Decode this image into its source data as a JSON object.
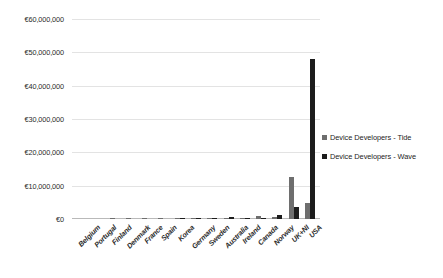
{
  "chart_data": {
    "type": "bar",
    "title": "",
    "xlabel": "",
    "ylabel": "",
    "ylim": [
      0,
      60000000
    ],
    "grid": true,
    "legend_position": "right",
    "currency_symbol": "€",
    "categories": [
      "Belgium",
      "Portugal",
      "Finland",
      "Denmark",
      "France",
      "Spain",
      "Korea",
      "Germany",
      "Sweden",
      "Australia",
      "Ireland",
      "Canada",
      "Norway",
      "UK+NI",
      "USA"
    ],
    "series": [
      {
        "name": "Device Developers - Tide",
        "color": "#6e6e6e",
        "values": [
          0,
          0,
          30000,
          60000,
          90000,
          120000,
          150000,
          200000,
          260000,
          330000,
          400000,
          900000,
          500000,
          12500000,
          4800000
        ]
      },
      {
        "name": "Device Developers - Wave",
        "color": "#1c1c1c",
        "values": [
          0,
          0,
          0,
          0,
          0,
          0,
          100000,
          400000,
          250000,
          500000,
          450000,
          250000,
          1100000,
          3500000,
          48000000
        ]
      }
    ],
    "y_ticks": [
      {
        "value": 0,
        "label": "€0"
      },
      {
        "value": 10000000,
        "label": "€10,000,000"
      },
      {
        "value": 20000000,
        "label": "€20,000,000"
      },
      {
        "value": 30000000,
        "label": "€30,000,000"
      },
      {
        "value": 40000000,
        "label": "€40,000,000"
      },
      {
        "value": 50000000,
        "label": "€50,000,000"
      },
      {
        "value": 60000000,
        "label": "€60,000,000"
      }
    ]
  },
  "legend": {
    "items": [
      {
        "label": "Device Developers - Tide",
        "swatch": "tide"
      },
      {
        "label": "Device Developers - Wave",
        "swatch": "wave"
      }
    ]
  }
}
